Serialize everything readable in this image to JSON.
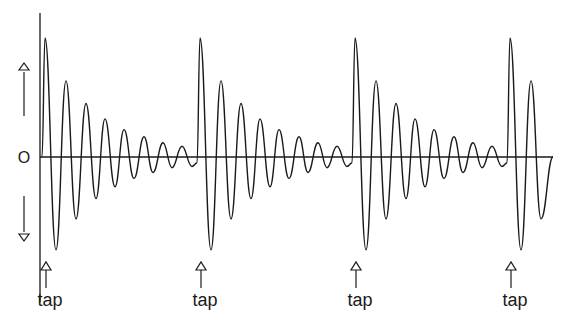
{
  "chart_data": {
    "type": "line",
    "title": "",
    "xlabel": "",
    "ylabel": "",
    "zero_label": "O",
    "y_direction_arrows": [
      "up",
      "down"
    ],
    "event_label": "tap",
    "tap_positions_px": [
      42,
      197,
      352,
      507
    ],
    "cycle_period_px": 155,
    "oscillation_period_px": 19.5,
    "peaks_first_cycle": {
      "x_px": [
        45,
        66,
        86,
        105,
        124,
        144,
        163,
        182
      ],
      "amplitude": [
        1.0,
        0.64,
        0.45,
        0.32,
        0.23,
        0.17,
        0.12,
        0.09
      ]
    },
    "troughs_first_cycle": {
      "x_px": [
        56,
        76,
        96,
        115,
        134,
        153,
        172,
        192
      ],
      "amplitude": [
        -0.78,
        -0.52,
        -0.35,
        -0.25,
        -0.18,
        -0.13,
        -0.09,
        -0.08
      ]
    },
    "baseline_y_px": 157,
    "max_amplitude_px": 119,
    "colors": {
      "line": "#1a1a1a",
      "background": "#ffffff"
    }
  },
  "labels": {
    "zero": "O",
    "taps": [
      "tap",
      "tap",
      "tap",
      "tap"
    ]
  }
}
